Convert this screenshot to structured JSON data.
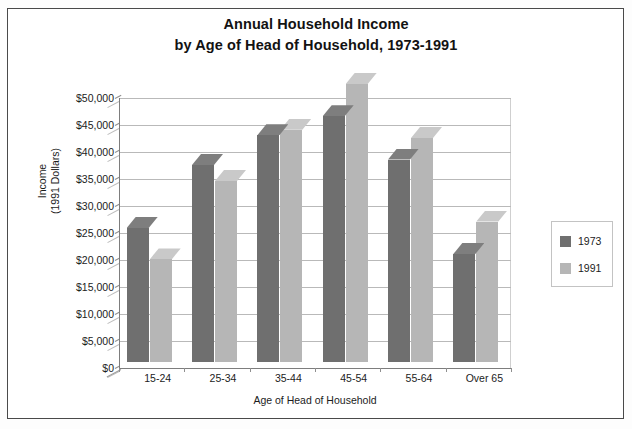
{
  "chart_data": {
    "type": "bar",
    "title": "Annual Household Income by Age of Head of Household, 1973-1991",
    "title_lines": [
      "Annual Household Income",
      "by Age of Head of Household, 1973-1991"
    ],
    "xlabel": "Age of Head of Household",
    "ylabel": "Income (1991 Dollars)",
    "ylabel_lines": [
      "Income",
      "(1991 Dollars)"
    ],
    "categories": [
      "15-24",
      "25-34",
      "35-44",
      "45-54",
      "55-64",
      "Over 65"
    ],
    "series": [
      {
        "name": "1973",
        "color": "#6f6f6f",
        "values": [
          24800,
          36500,
          42000,
          45500,
          37500,
          20000
        ]
      },
      {
        "name": "1991",
        "color": "#b6b6b6",
        "values": [
          19000,
          33500,
          43000,
          51500,
          41500,
          26000
        ]
      }
    ],
    "ylim": [
      0,
      50000
    ],
    "ytick_values": [
      0,
      5000,
      10000,
      15000,
      20000,
      25000,
      30000,
      35000,
      40000,
      45000,
      50000
    ],
    "ytick_labels": [
      "$0",
      "$5,000",
      "$10,000",
      "$15,000",
      "$20,000",
      "$25,000",
      "$30,000",
      "$35,000",
      "$40,000",
      "$45,000",
      "$50,000"
    ],
    "grid": true,
    "legend_position": "right",
    "style": "3d-column"
  },
  "legend": {
    "entries": [
      {
        "label": "1973"
      },
      {
        "label": "1991"
      }
    ]
  }
}
